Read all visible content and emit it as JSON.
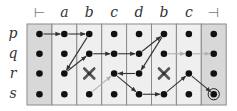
{
  "diagram": {
    "columns": [
      "⊢",
      "a",
      "b",
      "c",
      "d",
      "b",
      "c",
      "⊣"
    ],
    "rows": [
      "p",
      "q",
      "r",
      "s"
    ],
    "grid": {
      "x0": 27,
      "y0": 24,
      "col_w": 24.9,
      "row_h": 20.25,
      "first_dot_y": 34
    },
    "column_shading": [
      "#d8d8d8",
      "#efefef",
      "#efefef",
      "#efefef",
      "#efefef",
      "#efefef",
      "#efefef",
      "#d8d8d8"
    ],
    "border_color": "#8a8a8a",
    "dot_color": "#111111",
    "crosses": [
      {
        "col": 2,
        "row": 2
      },
      {
        "col": 5,
        "row": 2
      }
    ],
    "final_state": {
      "col": 7,
      "row": 3
    },
    "arrows_dark": [
      {
        "from": [
          0,
          0
        ],
        "to": [
          1,
          0
        ]
      },
      {
        "from": [
          1,
          0
        ],
        "to": [
          2,
          0
        ]
      },
      {
        "from": [
          2,
          0
        ],
        "to": [
          1,
          2
        ]
      },
      {
        "from": [
          1,
          2
        ],
        "to": [
          2,
          1
        ]
      },
      {
        "from": [
          2,
          1
        ],
        "to": [
          3,
          1
        ]
      },
      {
        "from": [
          3,
          1
        ],
        "to": [
          4,
          1
        ]
      },
      {
        "from": [
          4,
          1
        ],
        "to": [
          5,
          0
        ]
      },
      {
        "from": [
          5,
          0
        ],
        "to": [
          4,
          2
        ]
      },
      {
        "from": [
          4,
          2
        ],
        "to": [
          3,
          2
        ]
      },
      {
        "from": [
          3,
          2
        ],
        "to": [
          4,
          3
        ]
      },
      {
        "from": [
          4,
          3
        ],
        "to": [
          5,
          3
        ]
      },
      {
        "from": [
          5,
          3
        ],
        "to": [
          6,
          2
        ]
      },
      {
        "from": [
          6,
          2
        ],
        "to": [
          7,
          3
        ]
      }
    ],
    "arrows_light": [
      {
        "from": [
          2,
          3
        ],
        "to": [
          3,
          2
        ]
      },
      {
        "from": [
          5,
          1
        ],
        "to": [
          6,
          1
        ]
      },
      {
        "from": [
          6,
          1
        ],
        "to": [
          7,
          1
        ]
      }
    ],
    "colors": {
      "dark_arrow": "#333333",
      "light_arrow": "#b0b0b0",
      "cross": "#555555"
    }
  }
}
